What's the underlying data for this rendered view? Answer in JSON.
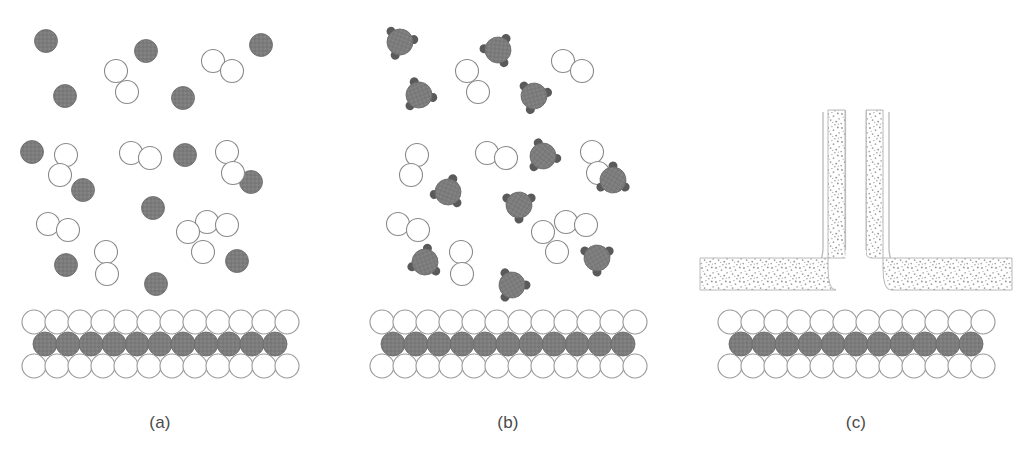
{
  "figure": {
    "type": "scientific-schematic",
    "background_color": "#ffffff",
    "width": 1025,
    "height": 453
  },
  "colors": {
    "particle_gray_fill": "#7c7c7c",
    "particle_gray_stroke": "#6a6a6a",
    "ligand_dark": "#5a5a5a",
    "open_circle_stroke": "#8a8a8a",
    "open_circle_fill": "#ffffff",
    "substrate_gray_fill": "#7e7e7e",
    "substrate_gray_stroke": "#6d6d6d",
    "substrate_white_stroke": "#9a9a9a",
    "stipple_dot": "#9a9a9a",
    "stipple_band_edge": "#b0b0b0",
    "thin_outline": "#b5b5b5",
    "label_text": "#4a4a4a"
  },
  "panels": [
    {
      "id": "a",
      "label": "(a)",
      "label_x": 160,
      "label_y": 428,
      "center_x": 160,
      "species": "atoms and dimers",
      "gray_particle_count": 13,
      "open_pair_count": 10
    },
    {
      "id": "b",
      "label": "(b)",
      "label_x": 508,
      "label_y": 428,
      "center_x": 508,
      "species": "ligated molecules and dimers",
      "molecule_count": 11,
      "open_pair_count": 10,
      "ligands_per_molecule": 3
    },
    {
      "id": "c",
      "label": "(c)",
      "label_x": 856,
      "label_y": 428,
      "center_x": 856,
      "species": "continuous stippled film with vertical column",
      "film_shape": "T-shaped / inverted-T channel"
    }
  ],
  "substrate": {
    "row_count": 3,
    "column_count": 12,
    "rows": [
      {
        "name": "top-row",
        "fill": "white"
      },
      {
        "name": "middle-row",
        "fill": "gray"
      },
      {
        "name": "bottom-row",
        "fill": "white"
      }
    ],
    "circle_radius": 12,
    "top_y": 322,
    "mid_y": 344,
    "bot_y": 366,
    "panel_origins": [
      34,
      382,
      730
    ],
    "pitch": 23
  },
  "panel_a_particles": {
    "gray_atoms": [
      {
        "cx": 46,
        "cy": 41
      },
      {
        "cx": 146,
        "cy": 51
      },
      {
        "cx": 261,
        "cy": 45
      },
      {
        "cx": 65,
        "cy": 96
      },
      {
        "cx": 183,
        "cy": 98
      },
      {
        "cx": 32,
        "cy": 152
      },
      {
        "cx": 185,
        "cy": 155
      },
      {
        "cx": 251,
        "cy": 182
      },
      {
        "cx": 83,
        "cy": 190
      },
      {
        "cx": 153,
        "cy": 208
      },
      {
        "cx": 66,
        "cy": 265
      },
      {
        "cx": 237,
        "cy": 261
      },
      {
        "cx": 156,
        "cy": 284
      }
    ],
    "open_pairs": [
      {
        "x1": 116,
        "y1": 71,
        "x2": 127,
        "y2": 92
      },
      {
        "x1": 213,
        "y1": 61,
        "x2": 232,
        "y2": 71
      },
      {
        "x1": 66,
        "y1": 155,
        "x2": 60,
        "y2": 175
      },
      {
        "x1": 131,
        "y1": 153,
        "x2": 150,
        "y2": 158
      },
      {
        "x1": 227,
        "y1": 152,
        "x2": 233,
        "y2": 173
      },
      {
        "x1": 48,
        "y1": 224,
        "x2": 68,
        "y2": 230
      },
      {
        "x1": 207,
        "y1": 222,
        "x2": 227,
        "y2": 225
      },
      {
        "x1": 106,
        "y1": 252,
        "x2": 107,
        "y2": 274
      },
      {
        "x1": 186,
        "y1": 255,
        "x2": 203,
        "y2": 271
      },
      {
        "x1": 188,
        "y1": 232,
        "x2": 173,
        "y2": 243
      }
    ]
  },
  "panel_b_particles": {
    "molecules": [
      {
        "cx": 400,
        "cy": 42,
        "rot": 20
      },
      {
        "cx": 498,
        "cy": 50,
        "rot": 95
      },
      {
        "cx": 419,
        "cy": 95,
        "rot": 160
      },
      {
        "cx": 534,
        "cy": 96,
        "rot": 255
      },
      {
        "cx": 543,
        "cy": 156,
        "rot": 40
      },
      {
        "cx": 448,
        "cy": 192,
        "rot": 200
      },
      {
        "cx": 613,
        "cy": 180,
        "rot": 300
      },
      {
        "cx": 519,
        "cy": 205,
        "rot": 120
      },
      {
        "cx": 425,
        "cy": 262,
        "rot": 70
      },
      {
        "cx": 597,
        "cy": 258,
        "rot": 240
      },
      {
        "cx": 512,
        "cy": 285,
        "rot": 150
      }
    ],
    "open_pairs": [
      {
        "x1": 467,
        "y1": 71,
        "x2": 478,
        "y2": 92
      },
      {
        "x1": 563,
        "y1": 61,
        "x2": 582,
        "y2": 71
      },
      {
        "x1": 417,
        "y1": 155,
        "x2": 411,
        "y2": 175
      },
      {
        "x1": 487,
        "y1": 153,
        "x2": 506,
        "y2": 158
      },
      {
        "x1": 592,
        "y1": 152,
        "x2": 598,
        "y2": 173
      },
      {
        "x1": 398,
        "y1": 224,
        "x2": 418,
        "y2": 230
      },
      {
        "x1": 566,
        "y1": 222,
        "x2": 586,
        "y2": 225
      },
      {
        "x1": 461,
        "y1": 252,
        "x2": 462,
        "y2": 274
      },
      {
        "x1": 546,
        "y1": 255,
        "x2": 560,
        "y2": 271
      },
      {
        "x1": 543,
        "y1": 232,
        "x2": 528,
        "y2": 243
      }
    ],
    "molecule_radius": 13,
    "ligand_radius": 4.5,
    "ligand_orbit": 14
  },
  "panel_c_film": {
    "band_thickness": 17,
    "horizontal_band_top": 258,
    "horizontal_band_bottom": 290,
    "column_top": 110,
    "left_band_inner_x": 845,
    "right_band_inner_x": 866,
    "left_extent": 700,
    "right_extent": 1012,
    "outline_offset": 22,
    "stipple_density": "fine random dots"
  }
}
